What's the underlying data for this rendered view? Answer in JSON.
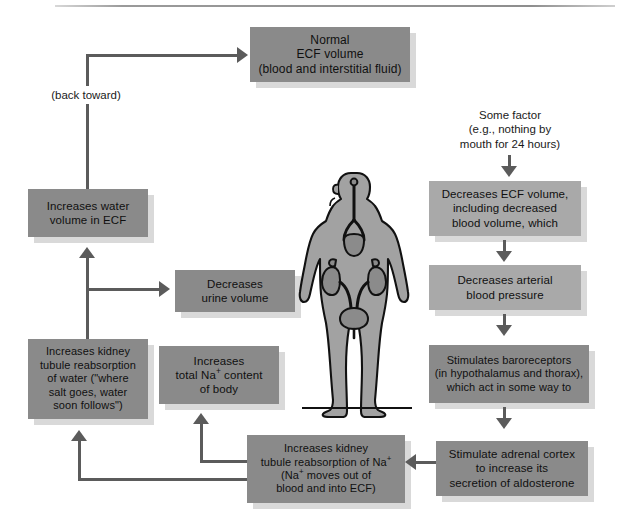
{
  "diagram": {
    "colors": {
      "box_dark": "#8a8a8a",
      "box_light": "#a9a9a9",
      "box_shadow": "#d9d9d9",
      "connector": "#5b5b5b",
      "text": "#101010",
      "body_fill": "#a0a0a0",
      "organ_fill": "#8e8e8e",
      "outline": "#111111",
      "page_background": "#ffffff"
    },
    "nodes": {
      "normal_ecf": {
        "id": "normal-ecf-volume",
        "lines": [
          "Normal",
          "ECF volume",
          "(blood and interstitial fluid)"
        ],
        "style": "dark"
      },
      "some_factor": {
        "id": "some-factor",
        "lines": [
          "Some factor",
          "(e.g., nothing by",
          "mouth for 24 hours)"
        ],
        "style": "plain"
      },
      "decreases_ecf": {
        "id": "decreases-ecf-volume",
        "lines": [
          "Decreases ECF volume,",
          "including decreased",
          "blood volume, which"
        ],
        "style": "light"
      },
      "decreases_bp": {
        "id": "decreases-arterial-blood-pressure",
        "lines": [
          "Decreases arterial",
          "blood pressure"
        ],
        "style": "light"
      },
      "baroreceptors": {
        "id": "stimulates-baroreceptors",
        "lines": [
          "Stimulates baroreceptors",
          "(in hypothalamus and thorax),",
          "which act in some way to"
        ],
        "style": "dark"
      },
      "adrenal_cortex": {
        "id": "stimulate-adrenal-cortex",
        "lines": [
          "Stimulate adrenal cortex",
          "to increase its",
          "secretion of aldosterone"
        ],
        "style": "dark"
      },
      "na_reabsorption": {
        "id": "increases-kidney-tubule-reabsorption-of-na",
        "lines": [
          "Increases kidney",
          "tubule reabsorption of Na+",
          "(Na+ moves out of",
          "blood and into ECF)"
        ],
        "style": "dark"
      },
      "total_na": {
        "id": "increases-total-na-content-of-body",
        "lines": [
          "Increases",
          "total Na+ content",
          "of body"
        ],
        "style": "dark"
      },
      "water_reabsorption": {
        "id": "increases-kidney-tubule-reabsorption-of-water",
        "lines": [
          "Increases kidney",
          "tubule reabsorption",
          "of water (\"where",
          "salt goes, water",
          "soon follows\")"
        ],
        "style": "dark"
      },
      "urine_volume": {
        "id": "decreases-urine-volume",
        "lines": [
          "Decreases",
          "urine volume"
        ],
        "style": "dark"
      },
      "water_in_ecf": {
        "id": "increases-water-volume-in-ecf",
        "lines": [
          "Increases water",
          "volume in ECF"
        ],
        "style": "dark"
      },
      "back_toward": {
        "id": "back-toward-label",
        "lines": [
          "(back toward)"
        ],
        "style": "plain"
      }
    },
    "figure": {
      "id": "human-body-urinary-system",
      "description": "Anterior view of human body silhouette showing kidneys, adrenal glands, ureters and urinary bladder"
    },
    "connector_count": 11
  }
}
